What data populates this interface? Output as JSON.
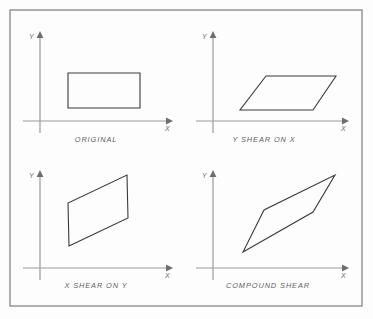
{
  "figure": {
    "background_color": "#fdfdfd",
    "border_color": "#8d8d8d",
    "axis_color": "#9a9a9a",
    "shape_color": "#3a3a3a",
    "caption_color": "#5d5d5d"
  },
  "frame": {
    "x": 10,
    "y": 10,
    "width": 352,
    "height": 296
  },
  "panels": [
    {
      "id": "original",
      "caption": "ORIGINAL",
      "caption_x": 96,
      "caption_y": 141,
      "axes": {
        "origin_x": 33,
        "origin_y": 121,
        "x_axis_end": 172,
        "y_axis_top": 33,
        "x_label": "X",
        "y_label": "Y",
        "x_label_x": 168,
        "x_label_y": 130,
        "y_label_x": 26,
        "y_label_y": 38
      },
      "shape": {
        "type": "rectangle",
        "points": [
          [
            68,
            73
          ],
          [
            140,
            73
          ],
          [
            140,
            108
          ],
          [
            68,
            108
          ]
        ]
      }
    },
    {
      "id": "y-shear-on-x",
      "caption": "Y SHEAR ON X",
      "caption_x": 262,
      "caption_y": 141,
      "axes": {
        "origin_x": 205,
        "origin_y": 121,
        "x_axis_end": 348,
        "y_axis_top": 33,
        "x_label": "X",
        "y_label": "Y",
        "x_label_x": 344,
        "x_label_y": 130,
        "y_label_x": 198,
        "y_label_y": 38
      },
      "shape": {
        "type": "parallelogram",
        "points": [
          [
            240,
            110
          ],
          [
            313,
            110
          ],
          [
            336,
            76
          ],
          [
            266,
            76
          ]
        ]
      }
    },
    {
      "id": "x-shear-on-y",
      "caption": "X SHEAR ON Y",
      "caption_x": 96,
      "caption_y": 287,
      "axes": {
        "origin_x": 33,
        "origin_y": 268,
        "x_axis_end": 172,
        "y_axis_top": 172,
        "x_label": "X",
        "y_label": "Y",
        "x_label_x": 168,
        "x_label_y": 277,
        "y_label_x": 26,
        "y_label_y": 177
      },
      "shape": {
        "type": "parallelogram",
        "points": [
          [
            69,
            246
          ],
          [
            128,
            218
          ],
          [
            127,
            175
          ],
          [
            68,
            203
          ]
        ]
      }
    },
    {
      "id": "compound-shear",
      "caption": "COMPOUND  SHEAR",
      "caption_x": 266,
      "caption_y": 287,
      "axes": {
        "origin_x": 205,
        "origin_y": 268,
        "x_axis_end": 348,
        "y_axis_top": 172,
        "x_label": "X",
        "y_label": "Y",
        "x_label_x": 344,
        "x_label_y": 277,
        "y_label_x": 198,
        "y_label_y": 177
      },
      "shape": {
        "type": "parallelogram",
        "points": [
          [
            243,
            252
          ],
          [
            313,
            212
          ],
          [
            335,
            175
          ],
          [
            264,
            210
          ]
        ]
      }
    }
  ]
}
